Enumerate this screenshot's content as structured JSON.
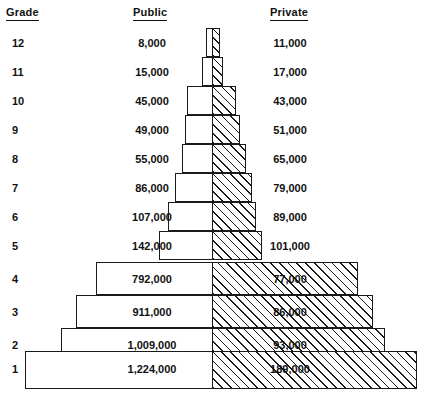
{
  "figure": {
    "type": "population-pyramid-table",
    "columns": {
      "grade_header": "Grade",
      "public_header": "Public",
      "private_header": "Private"
    }
  },
  "chart_data": {
    "type": "bar",
    "title": "",
    "subtitle": "",
    "xlabel": "",
    "ylabel": "Grade",
    "orientation": "horizontal",
    "layout": "centered bilateral pyramid (public left, private right)",
    "grid": false,
    "legend_position": "column-headers",
    "categories": [
      "12",
      "11",
      "10",
      "9",
      "8",
      "7",
      "6",
      "5",
      "4",
      "3",
      "2",
      "1"
    ],
    "series": [
      {
        "name": "Public",
        "style": "outline",
        "values": [
          8000,
          15000,
          45000,
          49000,
          55000,
          86000,
          107000,
          142000,
          792000,
          911000,
          1009000,
          1224000
        ],
        "labels": [
          "8,000",
          "15,000",
          "45,000",
          "49,000",
          "55,000",
          "86,000",
          "107,000",
          "142,000",
          "792,000",
          "911,000",
          "1,009,000",
          "1,224,000"
        ]
      },
      {
        "name": "Private",
        "style": "diagonal-hatch",
        "values": [
          11000,
          17000,
          43000,
          51000,
          65000,
          79000,
          89000,
          101000,
          77000,
          86000,
          93000,
          189000
        ],
        "labels": [
          "11,000",
          "17,000",
          "43,000",
          "51,000",
          "65,000",
          "79,000",
          "89,000",
          "101,000",
          "77,000",
          "86,000",
          "93,000",
          "189,000"
        ]
      }
    ]
  },
  "rows": [
    {
      "grade": "12",
      "public": "8,000",
      "private": "11,000",
      "y": 28,
      "h": 29,
      "pub_x": 206,
      "pub_w": 6,
      "prv_x": 212,
      "prv_w": 8,
      "label_y": 37
    },
    {
      "grade": "11",
      "public": "15,000",
      "private": "17,000",
      "y": 57,
      "h": 29,
      "pub_x": 202,
      "pub_w": 10,
      "prv_x": 212,
      "prv_w": 11,
      "label_y": 66
    },
    {
      "grade": "10",
      "public": "45,000",
      "private": "43,000",
      "y": 86,
      "h": 29,
      "pub_x": 187,
      "pub_w": 25,
      "prv_x": 212,
      "prv_w": 24,
      "label_y": 95
    },
    {
      "grade": "9",
      "public": "49,000",
      "private": "51,000",
      "y": 115,
      "h": 29,
      "pub_x": 185,
      "pub_w": 27,
      "prv_x": 212,
      "prv_w": 28,
      "label_y": 124
    },
    {
      "grade": "8",
      "public": "55,000",
      "private": "65,000",
      "y": 144,
      "h": 29,
      "pub_x": 182,
      "pub_w": 30,
      "prv_x": 212,
      "prv_w": 34,
      "label_y": 153
    },
    {
      "grade": "7",
      "public": "86,000",
      "private": "79,000",
      "y": 173,
      "h": 29,
      "pub_x": 175,
      "pub_w": 37,
      "prv_x": 212,
      "prv_w": 40,
      "label_y": 182
    },
    {
      "grade": "6",
      "public": "107,000",
      "private": "89,000",
      "y": 202,
      "h": 29,
      "pub_x": 168,
      "pub_w": 44,
      "prv_x": 212,
      "prv_w": 44,
      "label_y": 211
    },
    {
      "grade": "5",
      "public": "142,000",
      "private": "101,000",
      "y": 231,
      "h": 29,
      "pub_x": 159,
      "pub_w": 53,
      "prv_x": 212,
      "prv_w": 50,
      "label_y": 240
    },
    {
      "grade": "4",
      "public": "792,000",
      "private": "77,000",
      "y": 262,
      "h": 33,
      "pub_x": 96,
      "pub_w": 116,
      "prv_x": 212,
      "prv_w": 146,
      "label_y": 273
    },
    {
      "grade": "3",
      "public": "911,000",
      "private": "86,000",
      "y": 295,
      "h": 33,
      "pub_x": 76,
      "pub_w": 136,
      "prv_x": 212,
      "prv_w": 161,
      "label_y": 306
    },
    {
      "grade": "2",
      "public": "1,009,000",
      "private": "93,000",
      "y": 328,
      "h": 33,
      "pub_x": 61,
      "pub_w": 151,
      "prv_x": 212,
      "prv_w": 173,
      "label_y": 339
    },
    {
      "grade": "1",
      "public": "1,224,000",
      "private": "189,000",
      "y": 351,
      "h": 38,
      "pub_x": 25,
      "pub_w": 187,
      "prv_x": 212,
      "prv_w": 205,
      "label_y": 363
    }
  ],
  "grade_label_x": 12
}
